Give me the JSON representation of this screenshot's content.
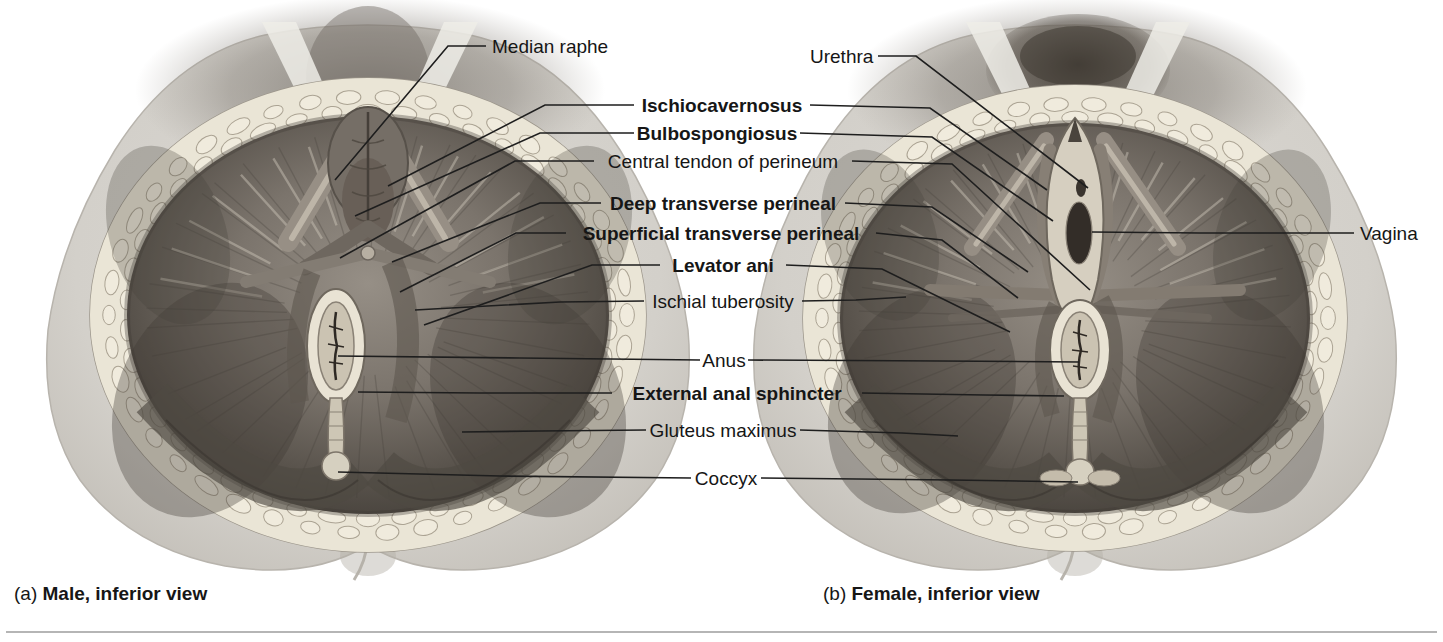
{
  "figure": {
    "panels": [
      {
        "id": "a",
        "caption_prefix": "(a) ",
        "caption": "Male, inferior view"
      },
      {
        "id": "b",
        "caption_prefix": "(b) ",
        "caption": "Female, inferior view"
      }
    ],
    "labels": [
      {
        "id": "median-raphe",
        "text": "Median raphe",
        "bold": false
      },
      {
        "id": "urethra",
        "text": "Urethra",
        "bold": false
      },
      {
        "id": "ischiocavernosus",
        "text": "Ischiocavernosus",
        "bold": true
      },
      {
        "id": "bulbospongiosus",
        "text": "Bulbospongiosus",
        "bold": true
      },
      {
        "id": "central-tendon",
        "text": "Central tendon of perineum",
        "bold": false
      },
      {
        "id": "deep-transverse",
        "text": "Deep transverse perineal",
        "bold": true
      },
      {
        "id": "superficial-transverse",
        "text": "Superficial transverse perineal",
        "bold": true
      },
      {
        "id": "levator-ani",
        "text": "Levator ani",
        "bold": true
      },
      {
        "id": "ischial-tuberosity",
        "text": "Ischial tuberosity",
        "bold": false
      },
      {
        "id": "anus",
        "text": "Anus",
        "bold": false
      },
      {
        "id": "external-anal-sphincter",
        "text": "External anal sphincter",
        "bold": true
      },
      {
        "id": "gluteus-maximus",
        "text": "Gluteus maximus",
        "bold": false
      },
      {
        "id": "coccyx",
        "text": "Coccyx",
        "bold": false
      },
      {
        "id": "vagina",
        "text": "Vagina",
        "bold": false
      }
    ],
    "colors": {
      "leader_line": "#1e1e1e",
      "label_text": "#161616",
      "skin": "#d8d5d0",
      "fat": "#eae5d6",
      "muscle_mid": "#7d766e",
      "muscle_dark": "#554f48",
      "rim_white": "#e9e3d4",
      "bottom_rule": "#b5b5b5"
    }
  }
}
